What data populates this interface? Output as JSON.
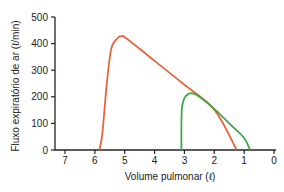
{
  "chart_data": {
    "type": "line",
    "title": "",
    "xlabel": "Volume pulmonar (ℓ)",
    "ylabel": "Fluxo expiratório de ar (ℓ/min)",
    "xlim": [
      7,
      0
    ],
    "ylim": [
      0,
      500
    ],
    "x_reversed": true,
    "xticks": [
      7,
      6,
      5,
      4,
      3,
      2,
      1,
      0
    ],
    "yticks": [
      0,
      100,
      200,
      300,
      400,
      500
    ],
    "grid": false,
    "legend": null,
    "series": [
      {
        "name": "orange-curve",
        "color": "#e8643c",
        "points": [
          [
            5.85,
            0
          ],
          [
            5.75,
            60
          ],
          [
            5.6,
            250
          ],
          [
            5.45,
            380
          ],
          [
            5.25,
            420
          ],
          [
            5.1,
            428
          ],
          [
            4.95,
            420
          ],
          [
            4.0,
            335
          ],
          [
            3.0,
            245
          ],
          [
            2.0,
            152
          ],
          [
            1.25,
            0
          ]
        ]
      },
      {
        "name": "green-curve",
        "color": "#3fa84a",
        "points": [
          [
            3.1,
            0
          ],
          [
            3.1,
            100
          ],
          [
            3.08,
            160
          ],
          [
            3.0,
            195
          ],
          [
            2.85,
            212
          ],
          [
            2.7,
            212
          ],
          [
            2.5,
            200
          ],
          [
            2.0,
            155
          ],
          [
            1.5,
            100
          ],
          [
            1.0,
            45
          ],
          [
            0.8,
            0
          ]
        ]
      }
    ]
  }
}
